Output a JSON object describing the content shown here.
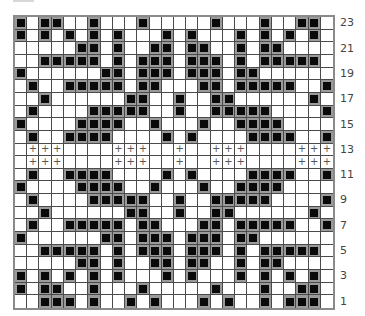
{
  "chart": {
    "title": "",
    "columns": 26,
    "rows": 23,
    "colors": {
      "filled_bg": "#9a9a9a",
      "filled_square": "#0a0a0a",
      "empty": "#ffffff",
      "border": "#8a8a8a",
      "plus": "#555555"
    },
    "plus_symbol": "+",
    "row_labels": [
      "23",
      "21",
      "19",
      "17",
      "15",
      "13",
      "11",
      "9",
      "7",
      "5",
      "3",
      "1"
    ],
    "grid_rows_top_to_bottom": [
      {
        "row": 23,
        "filled": [
          0,
          2,
          3,
          6,
          10,
          16,
          20,
          23,
          24
        ],
        "plus": []
      },
      {
        "row": 22,
        "filled": [
          0,
          2,
          4,
          6,
          8,
          12,
          14,
          18,
          20,
          22,
          24
        ],
        "plus": []
      },
      {
        "row": 21,
        "filled": [
          5,
          6,
          8,
          11,
          12,
          14,
          15,
          18,
          20,
          21
        ],
        "plus": []
      },
      {
        "row": 20,
        "filled": [
          2,
          3,
          4,
          5,
          6,
          8,
          10,
          11,
          12,
          14,
          15,
          16,
          18,
          20,
          21,
          22,
          23,
          24
        ],
        "plus": []
      },
      {
        "row": 19,
        "filled": [
          0,
          7,
          8,
          10,
          11,
          12,
          14,
          15,
          16,
          18,
          19
        ],
        "plus": []
      },
      {
        "row": 18,
        "filled": [
          1,
          4,
          5,
          6,
          7,
          8,
          10,
          11,
          15,
          16,
          18,
          19,
          20,
          21,
          22,
          25
        ],
        "plus": []
      },
      {
        "row": 17,
        "filled": [
          2,
          9,
          10,
          13,
          16,
          17,
          24
        ],
        "plus": []
      },
      {
        "row": 16,
        "filled": [
          1,
          6,
          7,
          8,
          9,
          10,
          13,
          16,
          17,
          18,
          19,
          20,
          25
        ],
        "plus": []
      },
      {
        "row": 15,
        "filled": [
          0,
          5,
          6,
          7,
          8,
          11,
          15,
          18,
          19,
          20,
          21
        ],
        "plus": []
      },
      {
        "row": 14,
        "filled": [
          1,
          4,
          5,
          6,
          7,
          12,
          14,
          19,
          20,
          21,
          22,
          25
        ],
        "plus": []
      },
      {
        "row": 13,
        "filled": [],
        "plus": [
          1,
          2,
          3,
          8,
          9,
          10,
          13,
          16,
          17,
          18,
          23,
          24,
          25
        ]
      },
      {
        "row": 12,
        "filled": [],
        "plus": [
          1,
          2,
          3,
          8,
          9,
          10,
          13,
          16,
          17,
          18,
          23,
          24,
          25
        ]
      },
      {
        "row": 11,
        "filled": [
          1,
          4,
          5,
          6,
          7,
          12,
          14,
          19,
          20,
          21,
          22,
          25
        ],
        "plus": []
      },
      {
        "row": 10,
        "filled": [
          0,
          5,
          6,
          7,
          8,
          11,
          15,
          18,
          19,
          20,
          21
        ],
        "plus": []
      },
      {
        "row": 9,
        "filled": [
          1,
          6,
          7,
          8,
          9,
          10,
          13,
          16,
          17,
          18,
          19,
          20,
          25
        ],
        "plus": []
      },
      {
        "row": 8,
        "filled": [
          2,
          9,
          10,
          13,
          16,
          17,
          24
        ],
        "plus": []
      },
      {
        "row": 7,
        "filled": [
          1,
          4,
          5,
          6,
          7,
          8,
          10,
          11,
          15,
          16,
          18,
          19,
          20,
          21,
          22,
          25
        ],
        "plus": []
      },
      {
        "row": 6,
        "filled": [
          0,
          7,
          8,
          10,
          11,
          12,
          14,
          15,
          16,
          18,
          19
        ],
        "plus": []
      },
      {
        "row": 5,
        "filled": [
          2,
          3,
          4,
          5,
          6,
          8,
          10,
          11,
          12,
          14,
          15,
          16,
          18,
          20,
          21,
          22,
          23,
          24
        ],
        "plus": []
      },
      {
        "row": 4,
        "filled": [
          5,
          6,
          8,
          11,
          12,
          14,
          15,
          18,
          20,
          21
        ],
        "plus": []
      },
      {
        "row": 3,
        "filled": [
          0,
          2,
          4,
          6,
          8,
          12,
          14,
          18,
          20,
          22,
          24
        ],
        "plus": []
      },
      {
        "row": 2,
        "filled": [
          0,
          2,
          3,
          6,
          10,
          16,
          20,
          23,
          24
        ],
        "plus": []
      },
      {
        "row": 1,
        "filled": [
          2,
          3,
          4,
          6,
          9,
          11,
          15,
          17,
          20,
          22,
          23,
          24
        ],
        "plus": []
      }
    ]
  }
}
